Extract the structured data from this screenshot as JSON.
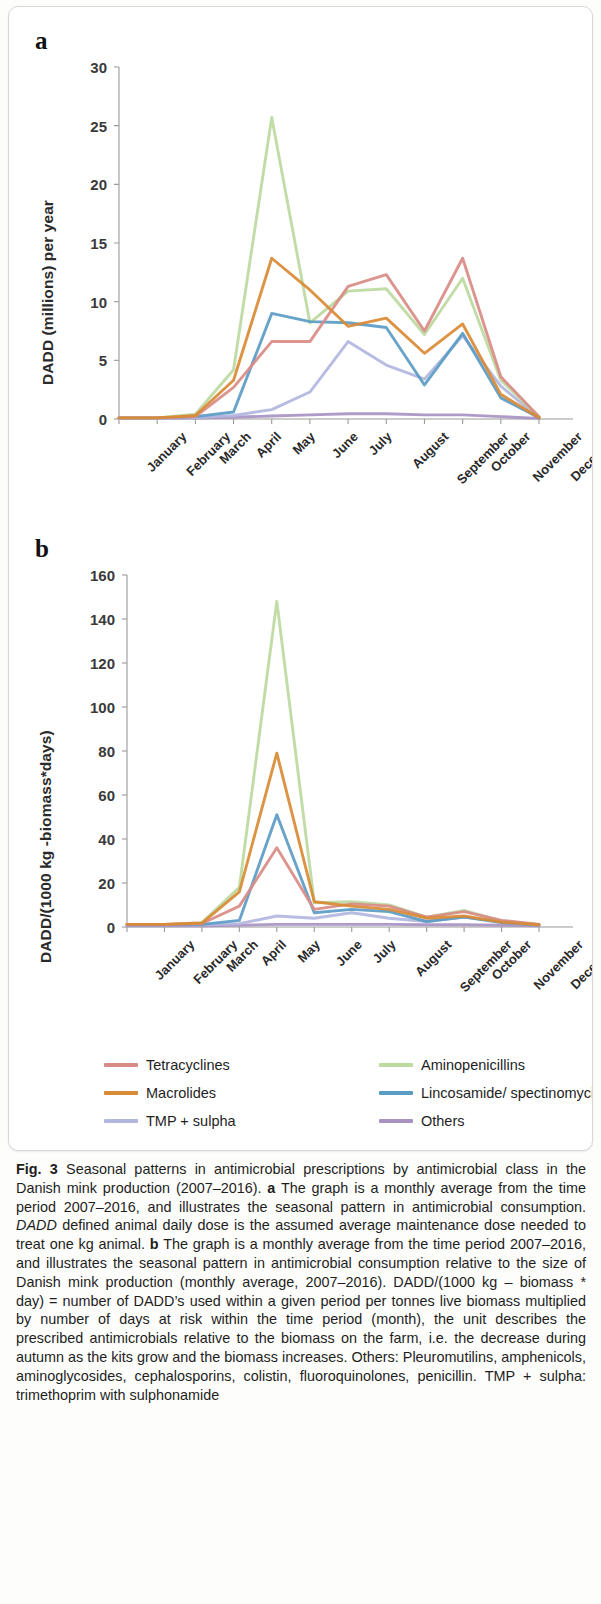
{
  "figure": {
    "label": "Fig. 3",
    "caption_segments": [
      {
        "text": "Fig. 3",
        "style": "bold"
      },
      {
        "text": " Seasonal patterns in antimicrobial prescriptions by antimicrobial class in the Danish mink production (2007–2016). ",
        "style": "normal"
      },
      {
        "text": "a",
        "style": "bold"
      },
      {
        "text": " The graph is a monthly average from the time period 2007–2016, and illustrates the seasonal pattern in antimicrobial consumption. ",
        "style": "normal"
      },
      {
        "text": "DADD",
        "style": "italic"
      },
      {
        "text": " defined animal daily dose is the assumed average maintenance dose needed to treat one kg animal. ",
        "style": "normal"
      },
      {
        "text": "b",
        "style": "bold"
      },
      {
        "text": " The graph is a monthly average from the time period 2007–2016, and illustrates the seasonal pattern in antimicrobial consumption relative to the size of Danish mink production (monthly average, 2007–2016). DADD/(1000 kg – biomass * day) = number of DADD’s used within a given period per tonnes live biomass multiplied by number of days at risk within the time period (month), the unit describes the prescribed antimicrobials relative to the biomass on the farm, i.e. the decrease during autumn as the kits grow and the biomass increases. Others: Pleuromutilins, amphenicols, aminoglycosides, cephalosporins, colistin, fluoroquinolones, penicillin. TMP + sulpha: trimethoprim with sulphonamide",
        "style": "normal"
      }
    ]
  },
  "legend": {
    "entries": [
      {
        "label": "Tetracyclines",
        "color": "#d98b86"
      },
      {
        "label": "Aminopenicillins",
        "color": "#bcd9a0"
      },
      {
        "label": "Macrolides",
        "color": "#d98a34"
      },
      {
        "label": "Lincosamide/ spectinomycin",
        "color": "#5b9bc4"
      },
      {
        "label": "TMP + sulpha",
        "color": "#b3b6e0"
      },
      {
        "label": "Others",
        "color": "#a892c2"
      }
    ]
  },
  "chart_data": [
    {
      "panel": "a",
      "type": "line",
      "title": "",
      "xlabel": "",
      "ylabel": "DADD (millions) per year",
      "ylim": [
        0,
        30
      ],
      "yticks": [
        0,
        5,
        10,
        15,
        20,
        25,
        30
      ],
      "grid": false,
      "legend_position": "below",
      "categories": [
        "January",
        "February",
        "March",
        "April",
        "May",
        "June",
        "July",
        "August",
        "September",
        "October",
        "November",
        "December"
      ],
      "series": [
        {
          "name": "Tetracyclines",
          "color": "#d98b86",
          "values": [
            0.1,
            0.1,
            0.2,
            2.7,
            6.6,
            6.6,
            11.3,
            12.3,
            7.5,
            13.7,
            3.6,
            0.2
          ]
        },
        {
          "name": "Aminopenicillins",
          "color": "#bcd9a0",
          "values": [
            0.1,
            0.1,
            0.4,
            4.2,
            25.7,
            8.2,
            10.9,
            11.1,
            7.2,
            12.0,
            3.3,
            0.2
          ]
        },
        {
          "name": "Macrolides",
          "color": "#d98a34",
          "values": [
            0.1,
            0.1,
            0.3,
            3.3,
            13.7,
            11.0,
            7.9,
            8.6,
            5.6,
            8.1,
            2.1,
            0.1
          ]
        },
        {
          "name": "Lincosamide/ spectinomycin",
          "color": "#5b9bc4",
          "values": [
            0.1,
            0.1,
            0.2,
            0.6,
            9.0,
            8.3,
            8.2,
            7.8,
            2.9,
            7.3,
            1.8,
            0.1
          ]
        },
        {
          "name": "TMP + sulpha",
          "color": "#b3b6e0",
          "values": [
            0.05,
            0.05,
            0.1,
            0.3,
            0.8,
            2.3,
            6.6,
            4.6,
            3.4,
            7.1,
            2.8,
            0.1
          ]
        },
        {
          "name": "Others",
          "color": "#a892c2",
          "values": [
            0.05,
            0.05,
            0.08,
            0.15,
            0.25,
            0.35,
            0.45,
            0.45,
            0.35,
            0.35,
            0.2,
            0.05
          ]
        }
      ]
    },
    {
      "panel": "b",
      "type": "line",
      "title": "",
      "xlabel": "",
      "ylabel": "DADD/(1000 kg -biomass*days)",
      "ylim": [
        0,
        160
      ],
      "yticks": [
        0,
        20,
        40,
        60,
        80,
        100,
        120,
        140,
        160
      ],
      "grid": false,
      "legend_position": "below",
      "categories": [
        "January",
        "February",
        "March",
        "April",
        "May",
        "June",
        "July",
        "August",
        "September",
        "October",
        "November",
        "December"
      ],
      "series": [
        {
          "name": "Tetracyclines",
          "color": "#d98b86",
          "values": [
            1.2,
            1.2,
            1.6,
            9.5,
            36.0,
            8.0,
            10.5,
            9.5,
            4.5,
            7.0,
            3.0,
            1.2
          ]
        },
        {
          "name": "Aminopenicillins",
          "color": "#bcd9a0",
          "values": [
            1.2,
            1.2,
            2.0,
            18.0,
            148.0,
            11.0,
            11.5,
            10.0,
            4.5,
            7.5,
            2.8,
            1.2
          ]
        },
        {
          "name": "Macrolides",
          "color": "#d98a34",
          "values": [
            1.2,
            1.2,
            1.8,
            16.0,
            79.0,
            11.5,
            9.5,
            8.0,
            4.0,
            5.0,
            2.2,
            1.0
          ]
        },
        {
          "name": "Lincosamide/ spectinomycin",
          "color": "#5b9bc4",
          "values": [
            1.0,
            1.0,
            1.2,
            3.0,
            51.0,
            6.5,
            8.0,
            7.0,
            2.5,
            4.5,
            2.0,
            1.0
          ]
        },
        {
          "name": "TMP + sulpha",
          "color": "#b3b6e0",
          "values": [
            1.0,
            1.0,
            1.0,
            1.5,
            5.0,
            4.0,
            6.5,
            4.0,
            2.5,
            4.5,
            2.5,
            1.0
          ]
        },
        {
          "name": "Others",
          "color": "#a892c2",
          "values": [
            0.6,
            0.6,
            0.6,
            0.8,
            1.2,
            1.2,
            1.2,
            1.2,
            1.0,
            1.0,
            0.8,
            0.6
          ]
        }
      ]
    }
  ],
  "panels": {
    "a": {
      "letter": "a"
    },
    "b": {
      "letter": "b"
    }
  }
}
